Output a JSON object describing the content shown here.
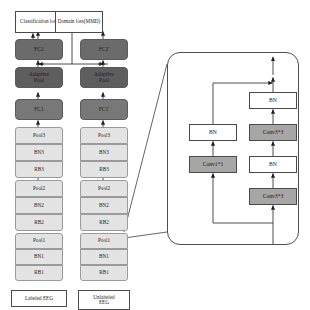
{
  "diagram": {
    "losses": [
      {
        "id": "classification_loss",
        "label": "Classification loss"
      },
      {
        "id": "domain_loss",
        "label": "Domain loss(MMD)"
      }
    ],
    "source_branch": {
      "name": "labeled-source-branch",
      "input": "Labeled EEG",
      "nodes": [
        {
          "id": "fc2",
          "label": "FC2"
        },
        {
          "id": "ap",
          "label_line1": "Adaptive",
          "label_line2": "Pool"
        },
        {
          "id": "fc1",
          "label": "FC1"
        },
        {
          "id": "pool3",
          "label": "Pool3"
        },
        {
          "id": "bn3",
          "label": "BN3"
        },
        {
          "id": "rb3",
          "label": "RB3"
        },
        {
          "id": "pool2",
          "label": "Pool2"
        },
        {
          "id": "bn2",
          "label": "BN2"
        },
        {
          "id": "rb2",
          "label": "RB2"
        },
        {
          "id": "pool1",
          "label": "Pool1"
        },
        {
          "id": "bn1",
          "label": "BN1"
        },
        {
          "id": "rb1",
          "label": "RB1"
        }
      ]
    },
    "target_branch": {
      "name": "unlabeled-target-branch",
      "input_line1": "Unlabeled",
      "input_line2": "EEG",
      "nodes": [
        {
          "id": "fc2p",
          "label": "FC2'"
        },
        {
          "id": "app",
          "label_line1": "Adaptive",
          "label_line2": "Pool"
        },
        {
          "id": "fc1p",
          "label": "FC1'"
        },
        {
          "id": "pool3p",
          "label": "Pool3"
        },
        {
          "id": "bn3p",
          "label": "BN3"
        },
        {
          "id": "rb3p",
          "label": "RB3"
        },
        {
          "id": "pool2p",
          "label": "Pool2"
        },
        {
          "id": "bn2p",
          "label": "BN2"
        },
        {
          "id": "rb2p",
          "label": "RB2"
        },
        {
          "id": "pool1p",
          "label": "Pool1"
        },
        {
          "id": "bn1p",
          "label": "BN1"
        },
        {
          "id": "rb1p",
          "label": "RB1"
        }
      ]
    },
    "residual_block": {
      "name": "residual-block-detail",
      "caption": "",
      "main_path": [
        {
          "id": "conv33_in",
          "label": "Conv3*3",
          "style": "gray"
        },
        {
          "id": "bn_mid",
          "label": "BN",
          "style": "white"
        },
        {
          "id": "conv33_out",
          "label": "Conv3*3",
          "style": "gray"
        },
        {
          "id": "bn_top",
          "label": "BN",
          "style": "white"
        }
      ],
      "shortcut_path": [
        {
          "id": "conv11",
          "label": "Conv1*1",
          "style": "gray"
        },
        {
          "id": "bn_sc",
          "label": "BN",
          "style": "white"
        }
      ]
    },
    "colors": {
      "fc_fill": "#6b6b6b",
      "adaptive_pool_fill": "#5e5e5e",
      "block_fill": "#e3e3e3",
      "conv_fill": "#a6a6a6",
      "box_stroke": "#4a4a4a",
      "arrow": "#222222"
    }
  }
}
